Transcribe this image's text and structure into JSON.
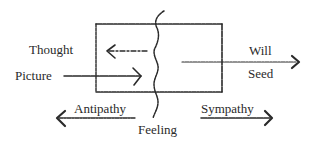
{
  "diagram": {
    "type": "soul-forces-box-diagram",
    "labels": {
      "thought": "Thought",
      "picture": "Picture",
      "will": "Will",
      "seed": "Seed",
      "antipathy": "Antipathy",
      "sympathy": "Sympathy",
      "feeling": "Feeling"
    },
    "arrows": [
      {
        "id": "thought-arrow",
        "direction": "left",
        "style": "dashed",
        "inside_box": true
      },
      {
        "id": "picture-arrow",
        "direction": "right",
        "style": "solid",
        "inside_box": true
      },
      {
        "id": "will-seed-arrow",
        "direction": "right",
        "style": "dotted"
      },
      {
        "id": "antipathy-arrow",
        "direction": "left",
        "style": "dashed"
      },
      {
        "id": "sympathy-arrow",
        "direction": "right",
        "style": "solid"
      }
    ],
    "colors": {
      "ink": "#2a2a2a",
      "background": "#ffffff"
    }
  }
}
